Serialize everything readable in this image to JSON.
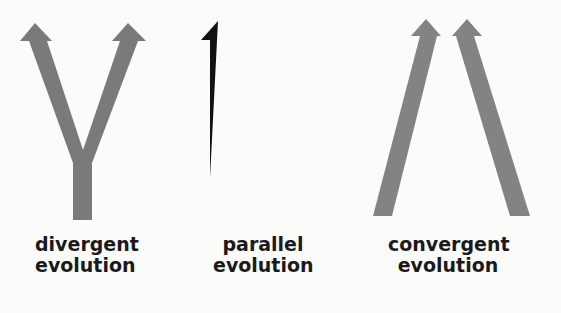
{
  "figure": {
    "colors": {
      "background": "#fbfbfa",
      "divergent_arrow": "#7a7a7a",
      "parallel_arrow": "#111111",
      "convergent_arrow": "#838383",
      "label_text": "#1a1a1a"
    },
    "panels": [
      {
        "id": "divergent",
        "icon": "fork-arrow-icon",
        "label_line1": "divergent",
        "label_line2": "evolution"
      },
      {
        "id": "parallel",
        "icon": "u-fork-arrow-icon",
        "label_line1": "parallel",
        "label_line2": "evolution"
      },
      {
        "id": "convergent",
        "icon": "converging-arrows-icon",
        "label_line1": "convergent",
        "label_line2": "evolution"
      }
    ]
  }
}
